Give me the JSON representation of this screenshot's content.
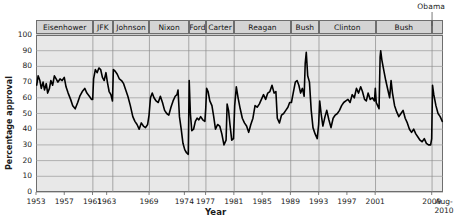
{
  "chart_data": {
    "type": "line",
    "title": "",
    "xlabel": "Year",
    "ylabel": "Percentage approval",
    "ylim": [
      0,
      100
    ],
    "yticks": [
      0,
      10,
      20,
      30,
      40,
      50,
      60,
      70,
      80,
      90,
      100
    ],
    "xlim": [
      1953,
      2010.6
    ],
    "xtick_labels": [
      "1953",
      "1957",
      "1961",
      "1963",
      "1969",
      "1974",
      "1977",
      "1981",
      "1985",
      "1989",
      "1993",
      "1997",
      "2001",
      "2009"
    ],
    "xtick_values": [
      1953,
      1957,
      1961,
      1963,
      1969,
      1974,
      1977,
      1981,
      1985,
      1989,
      1993,
      1997,
      2001,
      2009
    ],
    "xtick_extra_label_top": "Aug-",
    "xtick_extra_label_bottom": "2010",
    "grid": true,
    "legend_position": "none",
    "annotations": [
      "Obama"
    ],
    "presidents": [
      {
        "name": "Eisenhower",
        "start": 1953.05,
        "end": 1961.05
      },
      {
        "name": "JFK",
        "start": 1961.05,
        "end": 1963.87
      },
      {
        "name": "Johnson",
        "start": 1963.87,
        "end": 1969.05
      },
      {
        "name": "Nixon",
        "start": 1969.05,
        "end": 1974.62
      },
      {
        "name": "Ford",
        "start": 1974.62,
        "end": 1977.05
      },
      {
        "name": "Carter",
        "start": 1977.05,
        "end": 1981.05
      },
      {
        "name": "Reagan",
        "start": 1981.05,
        "end": 1989.05
      },
      {
        "name": "Bush",
        "start": 1989.05,
        "end": 1993.05
      },
      {
        "name": "Clinton",
        "start": 1993.05,
        "end": 2001.05
      },
      {
        "name": "Bush",
        "start": 2001.05,
        "end": 2009.05
      },
      {
        "name": "Obama",
        "start": 2009.05,
        "end": 2010.6
      }
    ],
    "series": [
      {
        "name": "Presidential job approval",
        "points": [
          [
            1953.1,
            68
          ],
          [
            1953.3,
            74
          ],
          [
            1953.55,
            71
          ],
          [
            1953.75,
            66
          ],
          [
            1954.0,
            70
          ],
          [
            1954.2,
            65
          ],
          [
            1954.45,
            69
          ],
          [
            1954.65,
            63
          ],
          [
            1954.9,
            66
          ],
          [
            1955.1,
            71
          ],
          [
            1955.35,
            68
          ],
          [
            1955.6,
            74
          ],
          [
            1955.85,
            72
          ],
          [
            1956.1,
            70
          ],
          [
            1956.4,
            72
          ],
          [
            1956.7,
            71
          ],
          [
            1957.0,
            73
          ],
          [
            1957.25,
            67
          ],
          [
            1957.55,
            63
          ],
          [
            1957.9,
            59
          ],
          [
            1958.2,
            55
          ],
          [
            1958.55,
            53
          ],
          [
            1958.9,
            57
          ],
          [
            1959.2,
            61
          ],
          [
            1959.55,
            64
          ],
          [
            1959.9,
            66
          ],
          [
            1960.2,
            63
          ],
          [
            1960.55,
            61
          ],
          [
            1960.85,
            59
          ],
          [
            1961.02,
            59
          ],
          [
            1961.15,
            72
          ],
          [
            1961.4,
            78
          ],
          [
            1961.65,
            76
          ],
          [
            1961.9,
            79
          ],
          [
            1962.15,
            78
          ],
          [
            1962.4,
            73
          ],
          [
            1962.65,
            71
          ],
          [
            1962.9,
            76
          ],
          [
            1963.1,
            70
          ],
          [
            1963.35,
            64
          ],
          [
            1963.6,
            62
          ],
          [
            1963.82,
            58
          ],
          [
            1963.95,
            78
          ],
          [
            1964.2,
            77
          ],
          [
            1964.5,
            75
          ],
          [
            1964.8,
            72
          ],
          [
            1965.1,
            71
          ],
          [
            1965.4,
            69
          ],
          [
            1965.7,
            65
          ],
          [
            1966.0,
            61
          ],
          [
            1966.35,
            55
          ],
          [
            1966.7,
            48
          ],
          [
            1967.0,
            45
          ],
          [
            1967.3,
            43
          ],
          [
            1967.6,
            40
          ],
          [
            1967.9,
            44
          ],
          [
            1968.2,
            42
          ],
          [
            1968.5,
            41
          ],
          [
            1968.8,
            43
          ],
          [
            1969.0,
            49
          ],
          [
            1969.2,
            60
          ],
          [
            1969.45,
            63
          ],
          [
            1969.7,
            60
          ],
          [
            1970.0,
            58
          ],
          [
            1970.3,
            57
          ],
          [
            1970.6,
            61
          ],
          [
            1970.9,
            57
          ],
          [
            1971.2,
            52
          ],
          [
            1971.5,
            50
          ],
          [
            1971.8,
            49
          ],
          [
            1972.1,
            54
          ],
          [
            1972.4,
            58
          ],
          [
            1972.7,
            61
          ],
          [
            1972.95,
            62
          ],
          [
            1973.1,
            65
          ],
          [
            1973.3,
            48
          ],
          [
            1973.55,
            40
          ],
          [
            1973.8,
            31
          ],
          [
            1974.05,
            27
          ],
          [
            1974.3,
            25
          ],
          [
            1974.55,
            24
          ],
          [
            1974.68,
            71
          ],
          [
            1974.85,
            50
          ],
          [
            1975.05,
            39
          ],
          [
            1975.3,
            40
          ],
          [
            1975.55,
            45
          ],
          [
            1975.8,
            47
          ],
          [
            1976.05,
            46
          ],
          [
            1976.3,
            48
          ],
          [
            1976.6,
            46
          ],
          [
            1976.9,
            45
          ],
          [
            1977.02,
            53
          ],
          [
            1977.15,
            66
          ],
          [
            1977.35,
            64
          ],
          [
            1977.6,
            58
          ],
          [
            1977.9,
            55
          ],
          [
            1978.15,
            48
          ],
          [
            1978.4,
            40
          ],
          [
            1978.7,
            43
          ],
          [
            1979.0,
            42
          ],
          [
            1979.3,
            37
          ],
          [
            1979.6,
            30
          ],
          [
            1979.9,
            33
          ],
          [
            1980.05,
            56
          ],
          [
            1980.25,
            52
          ],
          [
            1980.45,
            43
          ],
          [
            1980.7,
            33
          ],
          [
            1980.95,
            34
          ],
          [
            1981.12,
            55
          ],
          [
            1981.35,
            67
          ],
          [
            1981.6,
            60
          ],
          [
            1981.9,
            53
          ],
          [
            1982.2,
            47
          ],
          [
            1982.5,
            44
          ],
          [
            1982.8,
            42
          ],
          [
            1983.1,
            38
          ],
          [
            1983.4,
            43
          ],
          [
            1983.7,
            47
          ],
          [
            1984.0,
            55
          ],
          [
            1984.3,
            54
          ],
          [
            1984.6,
            56
          ],
          [
            1984.9,
            59
          ],
          [
            1985.2,
            62
          ],
          [
            1985.5,
            59
          ],
          [
            1985.8,
            63
          ],
          [
            1986.1,
            64
          ],
          [
            1986.4,
            68
          ],
          [
            1986.7,
            63
          ],
          [
            1986.95,
            64
          ],
          [
            1987.15,
            47
          ],
          [
            1987.45,
            44
          ],
          [
            1987.75,
            49
          ],
          [
            1988.05,
            50
          ],
          [
            1988.35,
            52
          ],
          [
            1988.65,
            54
          ],
          [
            1988.9,
            57
          ],
          [
            1989.15,
            57
          ],
          [
            1989.4,
            63
          ],
          [
            1989.7,
            70
          ],
          [
            1989.95,
            71
          ],
          [
            1990.2,
            68
          ],
          [
            1990.45,
            63
          ],
          [
            1990.7,
            66
          ],
          [
            1990.95,
            61
          ],
          [
            1991.1,
            82
          ],
          [
            1991.25,
            89
          ],
          [
            1991.45,
            74
          ],
          [
            1991.7,
            70
          ],
          [
            1991.95,
            52
          ],
          [
            1992.2,
            41
          ],
          [
            1992.5,
            37
          ],
          [
            1992.8,
            34
          ],
          [
            1993.0,
            43
          ],
          [
            1993.15,
            58
          ],
          [
            1993.35,
            50
          ],
          [
            1993.6,
            42
          ],
          [
            1993.9,
            48
          ],
          [
            1994.15,
            52
          ],
          [
            1994.45,
            46
          ],
          [
            1994.75,
            41
          ],
          [
            1995.05,
            47
          ],
          [
            1995.35,
            49
          ],
          [
            1995.65,
            50
          ],
          [
            1995.95,
            52
          ],
          [
            1996.25,
            55
          ],
          [
            1996.55,
            57
          ],
          [
            1996.85,
            58
          ],
          [
            1997.15,
            59
          ],
          [
            1997.45,
            57
          ],
          [
            1997.75,
            62
          ],
          [
            1998.05,
            60
          ],
          [
            1998.35,
            66
          ],
          [
            1998.65,
            63
          ],
          [
            1998.95,
            67
          ],
          [
            1999.2,
            64
          ],
          [
            1999.5,
            59
          ],
          [
            1999.75,
            58
          ],
          [
            2000.0,
            63
          ],
          [
            2000.3,
            59
          ],
          [
            2000.6,
            60
          ],
          [
            2000.9,
            58
          ],
          [
            2001.02,
            66
          ],
          [
            2001.15,
            57
          ],
          [
            2001.35,
            55
          ],
          [
            2001.55,
            53
          ],
          [
            2001.7,
            86
          ],
          [
            2001.78,
            90
          ],
          [
            2001.95,
            84
          ],
          [
            2002.2,
            78
          ],
          [
            2002.5,
            71
          ],
          [
            2002.8,
            65
          ],
          [
            2003.05,
            60
          ],
          [
            2003.25,
            71
          ],
          [
            2003.45,
            63
          ],
          [
            2003.75,
            55
          ],
          [
            2004.05,
            51
          ],
          [
            2004.35,
            48
          ],
          [
            2004.65,
            50
          ],
          [
            2004.95,
            52
          ],
          [
            2005.25,
            47
          ],
          [
            2005.55,
            44
          ],
          [
            2005.85,
            40
          ],
          [
            2006.15,
            38
          ],
          [
            2006.45,
            40
          ],
          [
            2006.75,
            37
          ],
          [
            2007.05,
            35
          ],
          [
            2007.35,
            33
          ],
          [
            2007.65,
            32
          ],
          [
            2007.95,
            34
          ],
          [
            2008.25,
            31
          ],
          [
            2008.55,
            30
          ],
          [
            2008.85,
            30
          ],
          [
            2009.0,
            34
          ],
          [
            2009.12,
            68
          ],
          [
            2009.3,
            62
          ],
          [
            2009.6,
            55
          ],
          [
            2009.9,
            50
          ],
          [
            2010.2,
            48
          ],
          [
            2010.5,
            45
          ]
        ]
      }
    ]
  }
}
